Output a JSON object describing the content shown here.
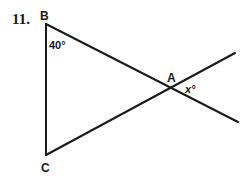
{
  "problem": {
    "number": "11."
  },
  "diagram": {
    "points": {
      "B": {
        "label": "B",
        "x": 46,
        "y": 24
      },
      "C": {
        "label": "C",
        "x": 46,
        "y": 155
      },
      "A": {
        "label": "A",
        "x": 173,
        "y": 88
      }
    },
    "angles": {
      "B": {
        "label": "40°",
        "value": 40
      },
      "A": {
        "label": "x°",
        "value": "x"
      }
    },
    "segments": [
      {
        "from": "B",
        "to": "C",
        "x1": 46,
        "y1": 24,
        "x2": 46,
        "y2": 155
      },
      {
        "from": "B",
        "through": "A",
        "x1": 46,
        "y1": 24,
        "x2": 238,
        "y2": 122
      },
      {
        "from": "C",
        "through": "A",
        "x1": 46,
        "y1": 155,
        "x2": 235,
        "y2": 53
      }
    ],
    "line_color": "#1a1a1a"
  }
}
